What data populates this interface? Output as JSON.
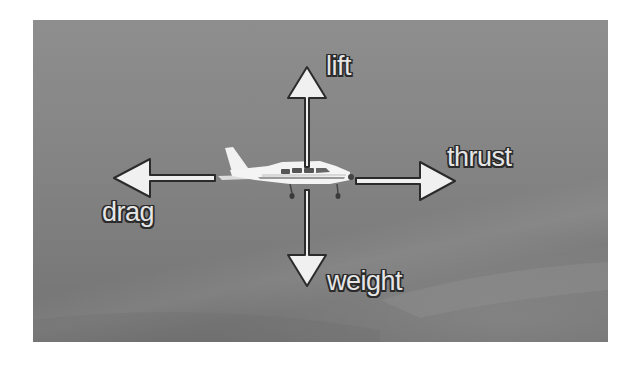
{
  "figure": {
    "background_tone": "#858585",
    "arrow_fill": "#f0f0f0",
    "arrow_outline": "#2b2b2b"
  },
  "forces": {
    "lift": {
      "label": "lift",
      "direction": "up"
    },
    "weight": {
      "label": "weight",
      "direction": "down"
    },
    "thrust": {
      "label": "thrust",
      "direction": "right"
    },
    "drag": {
      "label": "drag",
      "direction": "left"
    }
  }
}
